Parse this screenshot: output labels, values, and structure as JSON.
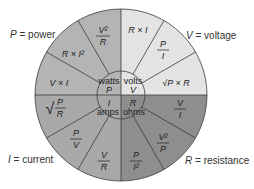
{
  "labels": {
    "power": {
      "var": "P",
      "text": " = power"
    },
    "voltage": {
      "var": "V",
      "text": " = voltage"
    },
    "current": {
      "var": "I",
      "text": " = current"
    },
    "resistance": {
      "var": "R",
      "text": " = resistance"
    }
  },
  "center": {
    "watts": {
      "unit": "watts",
      "var": "P"
    },
    "volts": {
      "unit": "volts",
      "var": "V"
    },
    "amps": {
      "unit": "amps",
      "var": "I"
    },
    "ohms": {
      "unit": "ohms",
      "var": "R"
    }
  },
  "formulas": {
    "power": [
      "V²/R",
      "R × I²",
      "V × I"
    ],
    "voltage": [
      "R × I",
      "P/I",
      "√(P × R)"
    ],
    "current": [
      "√(P/R)",
      "P/V",
      "V/R"
    ],
    "resistance": [
      "V/I",
      "V²/P",
      "P/I²"
    ]
  },
  "colors": {
    "power": "#b4b4b4",
    "voltage": "#e4e4e4",
    "current": "#a8a8a8",
    "resistance": "#8e8e8e",
    "line": "#3a3a3a"
  }
}
